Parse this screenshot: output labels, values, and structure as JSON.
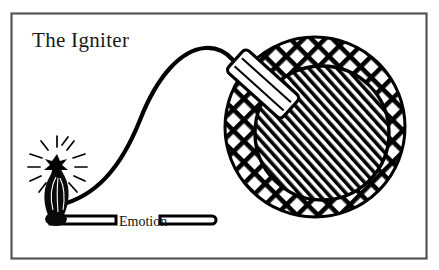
{
  "figure": {
    "title": "The Igniter",
    "label": "Emotion",
    "type": "line-illustration",
    "background_color": "#ffffff",
    "ink_color": "#000000",
    "frame": {
      "border_color": "#4a4a4a",
      "x": 11,
      "y": 13,
      "width": 416,
      "height": 246
    },
    "elements": [
      {
        "name": "bomb",
        "description": "Round bomb with crosshatched outer ring and diagonally hatched inner sphere",
        "center_x": 315,
        "center_y": 127,
        "outer_radius": 90,
        "inner_radius": 67,
        "outer_fill": "crosshatch",
        "inner_fill": "diagonal-hatch"
      },
      {
        "name": "fuse-tube",
        "description": "White cylindrical fuse holder tilted diagonally into the bomb",
        "angle_degrees": 40
      },
      {
        "name": "fuse",
        "description": "Curved S-shaped fuse cord running from match flame to bomb tube"
      },
      {
        "name": "match",
        "description": "Burning match stick with flame and radiating sparks",
        "stick_y": 220,
        "stick_x_start": 48,
        "stick_x_end": 216
      },
      {
        "name": "sparks",
        "count": 12
      }
    ]
  }
}
